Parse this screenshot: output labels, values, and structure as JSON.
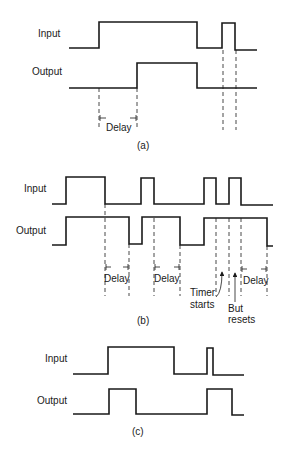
{
  "panels": [
    {
      "id": "a",
      "caption": "(a)",
      "input_label": "Input",
      "output_label": "Output",
      "delay_labels": [
        "Delay"
      ]
    },
    {
      "id": "b",
      "caption": "(b)",
      "input_label": "Input",
      "output_label": "Output",
      "delay_labels": [
        "Delay",
        "Delay",
        "Delay"
      ],
      "annotations": {
        "timer_starts_line1": "Timer",
        "timer_starts_line2": "starts",
        "but_resets_line1": "But",
        "but_resets_line2": "resets"
      }
    },
    {
      "id": "c",
      "caption": "(c)",
      "input_label": "Input",
      "output_label": "Output"
    }
  ],
  "colors": {
    "ink": "#1a1a1a",
    "background": "#ffffff"
  }
}
